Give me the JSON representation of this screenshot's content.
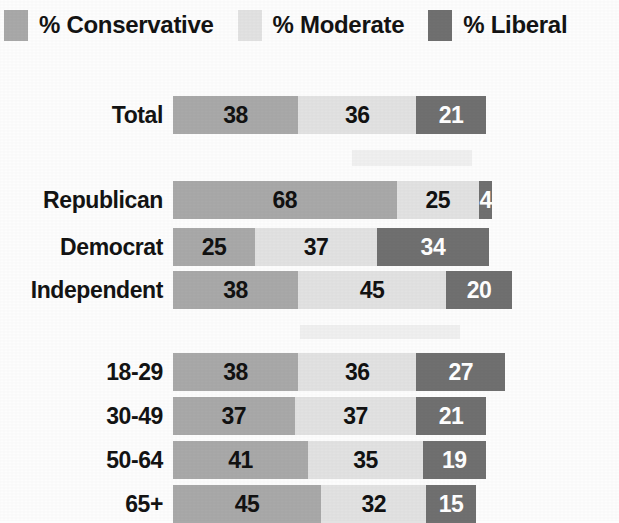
{
  "chart_data": {
    "type": "bar",
    "subtype": "stacked-horizontal-100",
    "title": "",
    "xlabel": "",
    "ylabel": "",
    "grid": false,
    "legend_position": "top",
    "value_suffix": "%",
    "categories": [
      "Total",
      "Republican",
      "Democrat",
      "Independent",
      "18-29",
      "30-49",
      "50-64",
      "65+"
    ],
    "series": [
      {
        "name": "% Conservative",
        "color": "#a9a9a9",
        "values": [
          38,
          68,
          25,
          38,
          38,
          37,
          41,
          45
        ]
      },
      {
        "name": "% Moderate",
        "color": "#e2e2e2",
        "values": [
          36,
          25,
          37,
          45,
          36,
          37,
          35,
          32
        ]
      },
      {
        "name": "% Liberal",
        "color": "#707070",
        "values": [
          21,
          4,
          34,
          20,
          27,
          21,
          19,
          15
        ]
      }
    ]
  },
  "legend": {
    "items": [
      {
        "label": "% Conservative",
        "color": "#a9a9a9",
        "swatch_name": "legend-swatch-conservative"
      },
      {
        "label": "% Moderate",
        "color": "#e2e2e2",
        "swatch_name": "legend-swatch-moderate"
      },
      {
        "label": "% Liberal",
        "color": "#707070",
        "swatch_name": "legend-swatch-liberal"
      }
    ]
  },
  "rows": [
    {
      "label": "Total",
      "top": 96,
      "conservative": "38",
      "moderate": "36",
      "liberal": "21"
    },
    {
      "label": "Republican",
      "top": 181,
      "conservative": "68",
      "moderate": "25",
      "liberal": "4"
    },
    {
      "label": "Democrat",
      "top": 228,
      "conservative": "25",
      "moderate": "37",
      "liberal": "34"
    },
    {
      "label": "Independent",
      "top": 271,
      "conservative": "38",
      "moderate": "45",
      "liberal": "20"
    },
    {
      "label": "18-29",
      "top": 353,
      "conservative": "38",
      "moderate": "36",
      "liberal": "27"
    },
    {
      "label": "30-49",
      "top": 397,
      "conservative": "37",
      "moderate": "37",
      "liberal": "21"
    },
    {
      "label": "50-64",
      "top": 441,
      "conservative": "41",
      "moderate": "35",
      "liberal": "19"
    },
    {
      "label": "65+",
      "top": 485,
      "conservative": "45",
      "moderate": "32",
      "liberal": "15"
    }
  ],
  "scale": {
    "px_per_percent": 3.29
  }
}
